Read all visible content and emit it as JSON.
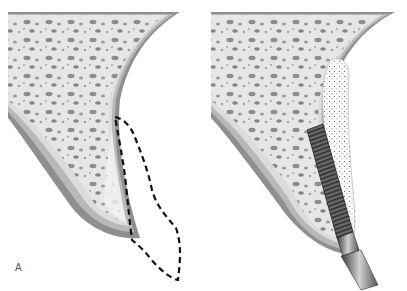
{
  "figure": {
    "panels": [
      {
        "label": "A",
        "description": "Alveolar ridge cross-section with resorbed bone; dashed outline shows original ridge contour"
      },
      {
        "label": "B",
        "description": "Alveolar ridge with bone graft (dotted) and threaded dental implant with abutment placed"
      }
    ],
    "colors": {
      "cortical_outer": "#8a8a8a",
      "cortical_mid": "#b5b5b5",
      "cortical_inner": "#d8d8d8",
      "cancellous": "#e8e8e8",
      "pores": "#7a7a7a",
      "graft": "#ffffff",
      "implant_dark": "#3a3a3a",
      "dashed_outline": "#111111"
    }
  }
}
